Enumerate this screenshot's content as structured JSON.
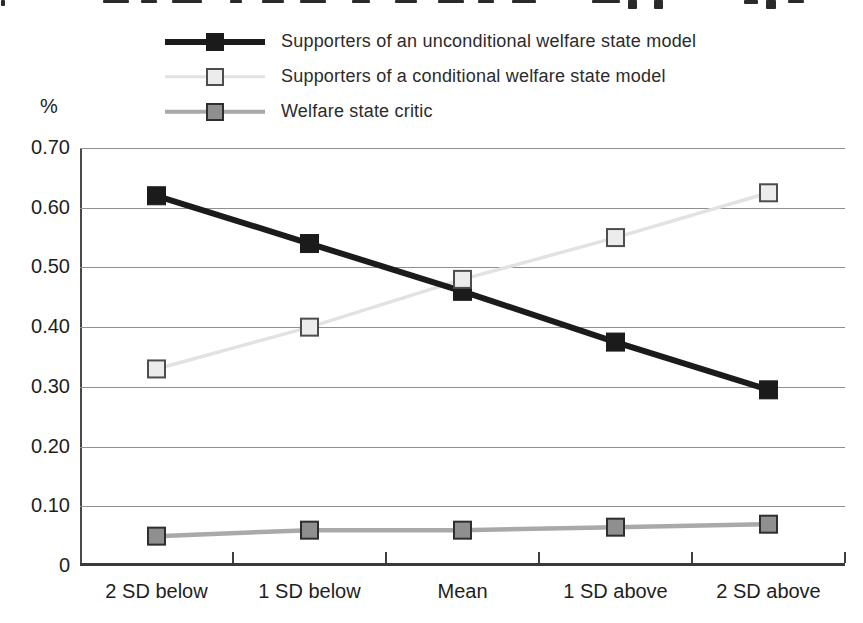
{
  "axis": {
    "percent_symbol": "%"
  },
  "chart_data": {
    "type": "line",
    "title": "",
    "ylabel": "%",
    "xlabel": "",
    "grid": true,
    "legend_position": "top-left",
    "categories": [
      "2 SD below",
      "1 SD below",
      "Mean",
      "1 SD above",
      "2 SD above"
    ],
    "ylim": [
      0,
      0.7
    ],
    "ytick_step": 0.1,
    "ytick_labels": [
      "0.70",
      "0.60",
      "0.50",
      "0.40",
      "0.30",
      "0.20",
      "0.10",
      "0"
    ],
    "series": [
      {
        "name": "Supporters of an unconditional welfare state model",
        "values": [
          0.62,
          0.54,
          0.46,
          0.375,
          0.295
        ],
        "line_color": "#1b1b1b",
        "line_width": 6,
        "marker_fill": "#1b1b1b",
        "marker_border": "#1b1b1b",
        "marker_stroke_width": 1,
        "marker_size": 18
      },
      {
        "name": "Supporters of a conditional welfare state model",
        "values": [
          0.33,
          0.4,
          0.48,
          0.55,
          0.625
        ],
        "line_color": "#e2e2e2",
        "line_width": 3.5,
        "marker_fill": "#ececec",
        "marker_border": "#4d4d4d",
        "marker_stroke_width": 2,
        "marker_size": 17
      },
      {
        "name": "Welfare state critic",
        "values": [
          0.05,
          0.06,
          0.06,
          0.065,
          0.07
        ],
        "line_color": "#a9a9a9",
        "line_width": 4.5,
        "marker_fill": "#8f8f8f",
        "marker_border": "#2e2e2e",
        "marker_stroke_width": 2,
        "marker_size": 17
      }
    ]
  }
}
